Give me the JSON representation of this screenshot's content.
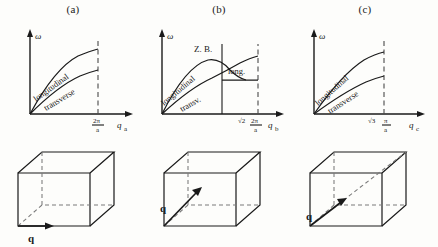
{
  "figure": {
    "background_color": "#fdfdfb",
    "line_color": "#1a1a1a",
    "dashed_color": "#4a4a4a"
  },
  "panels": [
    {
      "title": "(a)",
      "yaxis_label": "ω",
      "xaxis_label": "q",
      "xaxis_subscript": "a",
      "tick_numerator": "2π",
      "tick_denominator": "a",
      "tick_prefix": "",
      "zone_boundary_label": "",
      "curves": [
        {
          "name": "longitudinal",
          "label": "longitudinal"
        },
        {
          "name": "transverse",
          "label": "transverse"
        }
      ],
      "extra_curve_label": "",
      "cube_q_label": "q",
      "cube_q_direction": "edge"
    },
    {
      "title": "(b)",
      "yaxis_label": "ω",
      "xaxis_label": "q",
      "xaxis_subscript": "b",
      "tick_numerator": "2π",
      "tick_denominator": "a",
      "tick_prefix": "√2",
      "zone_boundary_label": "Z. B.",
      "curves": [
        {
          "name": "longitudinal",
          "label": "longitudinal"
        },
        {
          "name": "transverse",
          "label": "transv."
        }
      ],
      "extra_curve_label": "long.",
      "cube_q_label": "q",
      "cube_q_direction": "face-diagonal"
    },
    {
      "title": "(c)",
      "yaxis_label": "ω",
      "xaxis_label": "q",
      "xaxis_subscript": "c",
      "tick_numerator": "π",
      "tick_denominator": "a",
      "tick_prefix": "√3",
      "zone_boundary_label": "",
      "curves": [
        {
          "name": "longitudinal",
          "label": "longitudinal"
        },
        {
          "name": "transverse",
          "label": "transverse"
        }
      ],
      "extra_curve_label": "",
      "cube_q_label": "q",
      "cube_q_direction": "body-diagonal"
    }
  ]
}
